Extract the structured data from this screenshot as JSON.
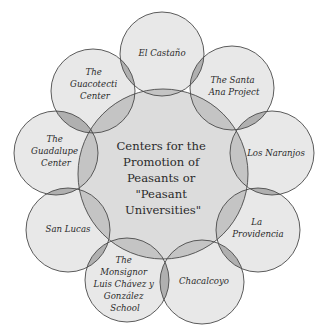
{
  "diagram": {
    "type": "radial-venn",
    "colors": {
      "circle_fill": "#e8e8e8",
      "center_fill": "#dcdcdc",
      "overlap_fill": "#b4b4b4",
      "stroke": "#4a4a4a",
      "text": "#2a2a2a"
    },
    "center": {
      "lines": [
        "Centers for the",
        "Promotion of",
        "Peasants or",
        "\"Peasant",
        "Universities\""
      ]
    },
    "nodes": [
      {
        "id": "el-castano",
        "lines": [
          "El Castaño"
        ]
      },
      {
        "id": "santa-ana",
        "lines": [
          "The Santa",
          "Ana Project"
        ]
      },
      {
        "id": "los-naranjos",
        "lines": [
          "Los Naranjos"
        ]
      },
      {
        "id": "la-providencia",
        "lines": [
          "La",
          "Providencia"
        ]
      },
      {
        "id": "chacalcoyo",
        "lines": [
          "Chacalcoyo"
        ]
      },
      {
        "id": "monsignor",
        "lines": [
          "The",
          "Monsignor",
          "Luis Chávez y",
          "González",
          "School"
        ]
      },
      {
        "id": "san-lucas",
        "lines": [
          "San Lucas"
        ]
      },
      {
        "id": "guadalupe",
        "lines": [
          "The",
          "Guadalupe",
          "Center"
        ]
      },
      {
        "id": "guacotecti",
        "lines": [
          "The",
          "Guacotecti",
          "Center"
        ]
      }
    ]
  }
}
